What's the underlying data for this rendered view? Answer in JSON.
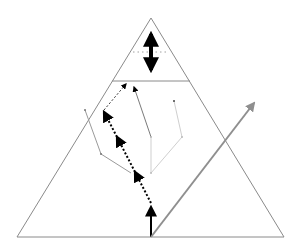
{
  "diagram": {
    "width": 301,
    "height": 250,
    "background": "#ffffff",
    "colors": {
      "outline": "#8a8a8a",
      "black": "#000000",
      "gray_arrow": "#8f8f8f",
      "branch_mid": "#9a9a9a",
      "branch_light": "#cfcfcf"
    },
    "triangle": {
      "apex": [
        151,
        18
      ],
      "base_left": [
        17,
        237
      ],
      "base_right": [
        284,
        237
      ]
    },
    "divider_line": {
      "y": 81,
      "x1": 112,
      "x2": 190
    },
    "top_dotted_line": {
      "y": 52,
      "x1": 133,
      "x2": 168
    },
    "double_arrow": {
      "x": 151,
      "y1": 24,
      "y2": 80
    },
    "base_arrow": {
      "from": [
        151,
        237
      ],
      "to": [
        151,
        203
      ]
    },
    "gray_arrow": {
      "from": [
        151,
        237
      ],
      "to": [
        256,
        100
      ]
    },
    "dotted_path": [
      [
        151,
        203
      ],
      [
        104,
        110
      ],
      [
        126,
        83
      ]
    ],
    "branches": [
      {
        "points": [
          [
            85,
            110
          ],
          [
            101,
            154
          ],
          [
            131,
            173
          ]
        ],
        "shade": "mid"
      },
      {
        "points": [
          [
            134,
            85
          ],
          [
            151,
            137
          ]
        ],
        "shade": "mid"
      },
      {
        "points": [
          [
            151,
            137
          ],
          [
            151,
            173
          ]
        ],
        "shade": "light"
      },
      {
        "points": [
          [
            151,
            173
          ],
          [
            182,
            137
          ],
          [
            174,
            101
          ]
        ],
        "shade": "light"
      }
    ]
  }
}
